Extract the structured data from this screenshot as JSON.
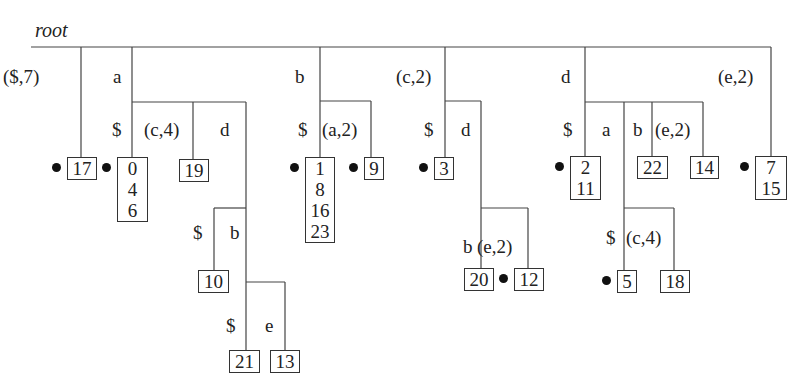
{
  "title": "root",
  "edge_labels": [
    {
      "id": "e1",
      "text": "($,7)",
      "x": 3,
      "y": 67
    },
    {
      "id": "e2",
      "text": "a",
      "x": 113,
      "y": 67
    },
    {
      "id": "e3",
      "text": "$",
      "x": 112,
      "y": 120
    },
    {
      "id": "e4",
      "text": "(c,4)",
      "x": 144,
      "y": 120
    },
    {
      "id": "e5",
      "text": "d",
      "x": 220,
      "y": 120
    },
    {
      "id": "e6",
      "text": "$",
      "x": 193,
      "y": 223
    },
    {
      "id": "e7",
      "text": "b",
      "x": 230,
      "y": 223
    },
    {
      "id": "e8",
      "text": "$",
      "x": 226,
      "y": 316
    },
    {
      "id": "e9",
      "text": "e",
      "x": 265,
      "y": 316
    },
    {
      "id": "e10",
      "text": "b",
      "x": 295,
      "y": 67
    },
    {
      "id": "e11",
      "text": "$",
      "x": 298,
      "y": 120
    },
    {
      "id": "e12",
      "text": "(a,2)",
      "x": 322,
      "y": 120
    },
    {
      "id": "e13",
      "text": "(c,2)",
      "x": 396,
      "y": 67
    },
    {
      "id": "e14",
      "text": "$",
      "x": 424,
      "y": 120
    },
    {
      "id": "e15",
      "text": "d",
      "x": 461,
      "y": 120
    },
    {
      "id": "e16",
      "text": "b",
      "x": 463,
      "y": 237
    },
    {
      "id": "e17",
      "text": "(e,2)",
      "x": 477,
      "y": 237
    },
    {
      "id": "e18",
      "text": "d",
      "x": 561,
      "y": 67
    },
    {
      "id": "e19",
      "text": "$",
      "x": 563,
      "y": 120
    },
    {
      "id": "e20",
      "text": "a",
      "x": 602,
      "y": 120
    },
    {
      "id": "e21",
      "text": "b",
      "x": 633,
      "y": 120
    },
    {
      "id": "e22",
      "text": "(e,2)",
      "x": 655,
      "y": 120
    },
    {
      "id": "e23",
      "text": "(e,2)",
      "x": 718,
      "y": 67
    },
    {
      "id": "e24",
      "text": "$",
      "x": 606,
      "y": 228
    },
    {
      "id": "e25",
      "text": "(c,4)",
      "x": 626,
      "y": 228
    }
  ],
  "leaves": [
    {
      "id": "l17",
      "values": [
        "17"
      ],
      "x": 67,
      "y": 157,
      "w": 30,
      "dot": true
    },
    {
      "id": "l0",
      "values": [
        "0",
        "4",
        "6"
      ],
      "x": 117,
      "y": 157,
      "w": 31,
      "dot": true
    },
    {
      "id": "l19",
      "values": [
        "19"
      ],
      "x": 179,
      "y": 159,
      "w": 30,
      "dot": false
    },
    {
      "id": "l10",
      "values": [
        "10"
      ],
      "x": 198,
      "y": 270,
      "w": 31,
      "dot": false
    },
    {
      "id": "l21",
      "values": [
        "21"
      ],
      "x": 229,
      "y": 350,
      "w": 31,
      "dot": false
    },
    {
      "id": "l13",
      "values": [
        "13"
      ],
      "x": 270,
      "y": 350,
      "w": 30,
      "dot": false
    },
    {
      "id": "l1",
      "values": [
        "1",
        "8",
        "16",
        "23"
      ],
      "x": 305,
      "y": 157,
      "w": 30,
      "dot": true
    },
    {
      "id": "l9",
      "values": [
        "9"
      ],
      "x": 364,
      "y": 157,
      "w": 20,
      "dot": true
    },
    {
      "id": "l3",
      "values": [
        "3"
      ],
      "x": 434,
      "y": 157,
      "w": 20,
      "dot": true
    },
    {
      "id": "l20",
      "values": [
        "20"
      ],
      "x": 464,
      "y": 268,
      "w": 30,
      "dot": false
    },
    {
      "id": "l12",
      "values": [
        "12"
      ],
      "x": 514,
      "y": 268,
      "w": 30,
      "dot": true
    },
    {
      "id": "l2",
      "values": [
        "2",
        "11"
      ],
      "x": 570,
      "y": 156,
      "w": 31,
      "dot": true
    },
    {
      "id": "l22",
      "values": [
        "22"
      ],
      "x": 637,
      "y": 156,
      "w": 31,
      "dot": false
    },
    {
      "id": "l14",
      "values": [
        "14"
      ],
      "x": 690,
      "y": 156,
      "w": 29,
      "dot": false
    },
    {
      "id": "l7",
      "values": [
        "7",
        "15"
      ],
      "x": 755,
      "y": 156,
      "w": 32,
      "dot": true
    },
    {
      "id": "l5",
      "values": [
        "5"
      ],
      "x": 617,
      "y": 270,
      "w": 20,
      "dot": true
    },
    {
      "id": "l18",
      "values": [
        "18"
      ],
      "x": 660,
      "y": 270,
      "w": 30,
      "dot": false
    }
  ]
}
